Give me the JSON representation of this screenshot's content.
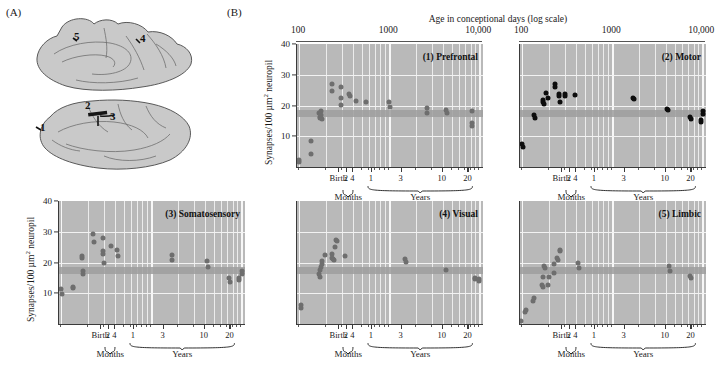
{
  "figure": {
    "panel_a_letter": "(A)",
    "panel_b_letter": "(B)"
  },
  "brain_diagram": {
    "name": "brain-regions-schematic",
    "region_numbers": [
      "1",
      "2",
      "3",
      "4",
      "5"
    ],
    "views": [
      "medial",
      "lateral"
    ],
    "fill_color": "#c9c9c9",
    "outline_color": "#4a4a4a"
  },
  "axis": {
    "top_title": "Age in conceptional days (log scale)",
    "top_ticks": [
      "100",
      "1000",
      "10,000"
    ],
    "y_label_prefix": "Synapses/100 ",
    "y_label_unit": "µm",
    "y_label_sup": "2",
    "y_label_suffix": " neuropil",
    "y_ticks": [
      "10",
      "20",
      "30",
      "40"
    ],
    "y_min": 0,
    "y_max": 40,
    "x_ticks_months": [
      "Birth",
      "2",
      "4"
    ],
    "x_ticks_years": [
      "1",
      "3",
      "10",
      "20"
    ],
    "brace_months": "Months",
    "brace_years": "Years"
  },
  "chart_data": [
    {
      "type": "scatter",
      "id": "prefrontal",
      "title": "(1) Prefrontal",
      "xlabel": "Age in conceptional days (log scale)",
      "ylabel": "Synapses/100 µm² neuropil",
      "xscale": "log",
      "xlim": [
        95,
        11000
      ],
      "ylim": [
        0,
        40
      ],
      "dot_color": "#6e6e6e",
      "band_range": [
        16.2,
        18.6
      ],
      "show_y_axis": true,
      "points": [
        {
          "x": 100,
          "y": 1.5
        },
        {
          "x": 101,
          "y": 2.2
        },
        {
          "x": 135,
          "y": 8.4
        },
        {
          "x": 137,
          "y": 4.3
        },
        {
          "x": 168,
          "y": 17.6
        },
        {
          "x": 170,
          "y": 16.4
        },
        {
          "x": 172,
          "y": 16.0
        },
        {
          "x": 174,
          "y": 18.3
        },
        {
          "x": 176,
          "y": 17.0
        },
        {
          "x": 178,
          "y": 15.7
        },
        {
          "x": 230,
          "y": 27.0
        },
        {
          "x": 233,
          "y": 24.6
        },
        {
          "x": 290,
          "y": 26.0
        },
        {
          "x": 293,
          "y": 22.6
        },
        {
          "x": 296,
          "y": 20.3
        },
        {
          "x": 360,
          "y": 23.9
        },
        {
          "x": 365,
          "y": 23.2
        },
        {
          "x": 430,
          "y": 21.6
        },
        {
          "x": 560,
          "y": 21.0
        },
        {
          "x": 1000,
          "y": 21.0
        },
        {
          "x": 1010,
          "y": 19.5
        },
        {
          "x": 2600,
          "y": 19.3
        },
        {
          "x": 2620,
          "y": 17.5
        },
        {
          "x": 4300,
          "y": 18.6
        },
        {
          "x": 4330,
          "y": 17.6
        },
        {
          "x": 8200,
          "y": 18.1
        },
        {
          "x": 8250,
          "y": 14.2
        },
        {
          "x": 8300,
          "y": 13.4
        }
      ]
    },
    {
      "type": "scatter",
      "id": "motor",
      "title": "(2) Motor",
      "xscale": "log",
      "xlim": [
        95,
        11000
      ],
      "ylim": [
        0,
        40
      ],
      "dot_color": "#0d0d0d",
      "band_range": [
        16.2,
        18.6
      ],
      "show_y_axis": false,
      "points": [
        {
          "x": 101,
          "y": 7.4
        },
        {
          "x": 102,
          "y": 6.4
        },
        {
          "x": 136,
          "y": 16.8
        },
        {
          "x": 138,
          "y": 16.0
        },
        {
          "x": 170,
          "y": 21.8
        },
        {
          "x": 173,
          "y": 21.0
        },
        {
          "x": 176,
          "y": 20.6
        },
        {
          "x": 186,
          "y": 24.1
        },
        {
          "x": 196,
          "y": 22.6
        },
        {
          "x": 232,
          "y": 27.0
        },
        {
          "x": 234,
          "y": 26.0
        },
        {
          "x": 255,
          "y": 23.6
        },
        {
          "x": 258,
          "y": 23.2
        },
        {
          "x": 262,
          "y": 21.0
        },
        {
          "x": 300,
          "y": 23.8
        },
        {
          "x": 303,
          "y": 23.2
        },
        {
          "x": 390,
          "y": 23.4
        },
        {
          "x": 1700,
          "y": 22.6
        },
        {
          "x": 1740,
          "y": 22.0
        },
        {
          "x": 4100,
          "y": 19.0
        },
        {
          "x": 4180,
          "y": 18.5
        },
        {
          "x": 7400,
          "y": 16.4
        },
        {
          "x": 7420,
          "y": 15.6
        },
        {
          "x": 9600,
          "y": 15.3
        },
        {
          "x": 9620,
          "y": 14.7
        },
        {
          "x": 10200,
          "y": 18.2
        },
        {
          "x": 10250,
          "y": 17.2
        }
      ]
    },
    {
      "type": "scatter",
      "id": "somatosensory",
      "title": "(3) Somatosensory",
      "ylabel": "Synapses/100 µm² neuropil",
      "xscale": "log",
      "xlim": [
        95,
        11000
      ],
      "ylim": [
        0,
        40
      ],
      "dot_color": "#6e6e6e",
      "band_range": [
        16.2,
        18.6
      ],
      "show_y_axis": true,
      "points": [
        {
          "x": 101,
          "y": 11.3
        },
        {
          "x": 103,
          "y": 9.8
        },
        {
          "x": 135,
          "y": 11.9
        },
        {
          "x": 137,
          "y": 11.6
        },
        {
          "x": 170,
          "y": 22.2
        },
        {
          "x": 172,
          "y": 21.5
        },
        {
          "x": 174,
          "y": 17.2
        },
        {
          "x": 176,
          "y": 16.3
        },
        {
          "x": 228,
          "y": 29.4
        },
        {
          "x": 231,
          "y": 26.8
        },
        {
          "x": 290,
          "y": 28.1
        },
        {
          "x": 293,
          "y": 23.6
        },
        {
          "x": 296,
          "y": 22.9
        },
        {
          "x": 299,
          "y": 19.9
        },
        {
          "x": 360,
          "y": 25.4
        },
        {
          "x": 420,
          "y": 24.0
        },
        {
          "x": 424,
          "y": 22.1
        },
        {
          "x": 1700,
          "y": 22.6
        },
        {
          "x": 1720,
          "y": 20.8
        },
        {
          "x": 4200,
          "y": 20.4
        },
        {
          "x": 4240,
          "y": 18.6
        },
        {
          "x": 7400,
          "y": 14.9
        },
        {
          "x": 7440,
          "y": 13.6
        },
        {
          "x": 9400,
          "y": 15.0
        },
        {
          "x": 9440,
          "y": 14.2
        },
        {
          "x": 10200,
          "y": 17.2
        },
        {
          "x": 10240,
          "y": 16.4
        }
      ]
    },
    {
      "type": "scatter",
      "id": "visual",
      "title": "(4) Visual",
      "xscale": "log",
      "xlim": [
        95,
        11000
      ],
      "ylim": [
        0,
        40
      ],
      "dot_color": "#6e6e6e",
      "band_range": [
        16.2,
        18.6
      ],
      "show_y_axis": false,
      "points": [
        {
          "x": 104,
          "y": 6.2
        },
        {
          "x": 105,
          "y": 5.2
        },
        {
          "x": 168,
          "y": 16.2
        },
        {
          "x": 170,
          "y": 15.4
        },
        {
          "x": 172,
          "y": 17.4
        },
        {
          "x": 175,
          "y": 18.4
        },
        {
          "x": 178,
          "y": 19.6
        },
        {
          "x": 182,
          "y": 20.6
        },
        {
          "x": 196,
          "y": 22.5
        },
        {
          "x": 232,
          "y": 22.9
        },
        {
          "x": 235,
          "y": 21.6
        },
        {
          "x": 238,
          "y": 21.2
        },
        {
          "x": 242,
          "y": 20.8
        },
        {
          "x": 252,
          "y": 25.1
        },
        {
          "x": 258,
          "y": 27.4
        },
        {
          "x": 262,
          "y": 27.0
        },
        {
          "x": 320,
          "y": 22.2
        },
        {
          "x": 1500,
          "y": 21.0
        },
        {
          "x": 1520,
          "y": 20.3
        },
        {
          "x": 4300,
          "y": 17.6
        },
        {
          "x": 9000,
          "y": 15.0
        },
        {
          "x": 9040,
          "y": 14.6
        },
        {
          "x": 10000,
          "y": 14.6
        },
        {
          "x": 10050,
          "y": 13.9
        }
      ]
    },
    {
      "type": "scatter",
      "id": "limbic",
      "title": "(5) Limbic",
      "xscale": "log",
      "xlim": [
        95,
        11000
      ],
      "ylim": [
        0,
        40
      ],
      "dot_color": "#6e6e6e",
      "band_range": [
        16.2,
        18.6
      ],
      "show_y_axis": false,
      "points": [
        {
          "x": 98,
          "y": 1.0
        },
        {
          "x": 108,
          "y": 4.0
        },
        {
          "x": 112,
          "y": 4.6
        },
        {
          "x": 134,
          "y": 7.6
        },
        {
          "x": 136,
          "y": 8.4
        },
        {
          "x": 166,
          "y": 12.6
        },
        {
          "x": 169,
          "y": 11.9
        },
        {
          "x": 172,
          "y": 15.4
        },
        {
          "x": 176,
          "y": 18.8
        },
        {
          "x": 179,
          "y": 18.2
        },
        {
          "x": 196,
          "y": 12.6
        },
        {
          "x": 200,
          "y": 15.4
        },
        {
          "x": 225,
          "y": 19.5
        },
        {
          "x": 228,
          "y": 16.6
        },
        {
          "x": 245,
          "y": 21.6
        },
        {
          "x": 248,
          "y": 20.9
        },
        {
          "x": 262,
          "y": 24.2
        },
        {
          "x": 265,
          "y": 23.6
        },
        {
          "x": 420,
          "y": 20.0
        },
        {
          "x": 424,
          "y": 18.2
        },
        {
          "x": 4300,
          "y": 19.0
        },
        {
          "x": 4340,
          "y": 17.2
        },
        {
          "x": 7400,
          "y": 15.6
        },
        {
          "x": 7420,
          "y": 14.9
        }
      ]
    }
  ]
}
